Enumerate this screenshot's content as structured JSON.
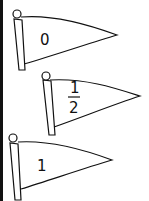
{
  "flags": [
    {
      "label": "0",
      "type": "whole"
    },
    {
      "label_numerator": "1",
      "label_denominator": "2",
      "type": "fraction"
    },
    {
      "label": "1",
      "type": "whole"
    }
  ],
  "colors": {
    "stroke": "#111111",
    "fill": "#ffffff"
  }
}
